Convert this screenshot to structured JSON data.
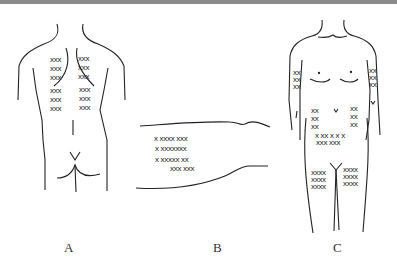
{
  "figure": {
    "panels": [
      {
        "id": "A",
        "label": "A",
        "view": "back (posterior torso)"
      },
      {
        "id": "B",
        "label": "B",
        "view": "thigh (lateral)"
      },
      {
        "id": "C",
        "label": "C",
        "view": "front (anterior body)"
      }
    ],
    "marks": {
      "A_left": [
        "xxx",
        "xxx",
        "xxx",
        "xxx",
        "xxx",
        "xxx"
      ],
      "A_right": [
        "xxx",
        "xxx",
        "xxx",
        "xxx",
        "xxx",
        "xxx"
      ],
      "B_rows": [
        "x xxxx xxx",
        "x xxxxxxx",
        "x xxxxx xx",
        "xxx xxx"
      ],
      "C_arm_left": [
        "xx",
        "xx",
        "xx"
      ],
      "C_arm_right": [
        "xx",
        "xx",
        "xx"
      ],
      "C_abd_left": [
        "xx",
        "xx",
        "xx"
      ],
      "C_abd_right": [
        "xx",
        "xx",
        "xx"
      ],
      "C_abd_low": [
        "x xx x x x",
        "xxx xxx"
      ],
      "C_thigh_left": [
        "xxxx",
        "xxxx",
        "xxxx"
      ],
      "C_thigh_right": [
        "xxxx",
        "xxxx",
        "xxxx"
      ]
    }
  }
}
